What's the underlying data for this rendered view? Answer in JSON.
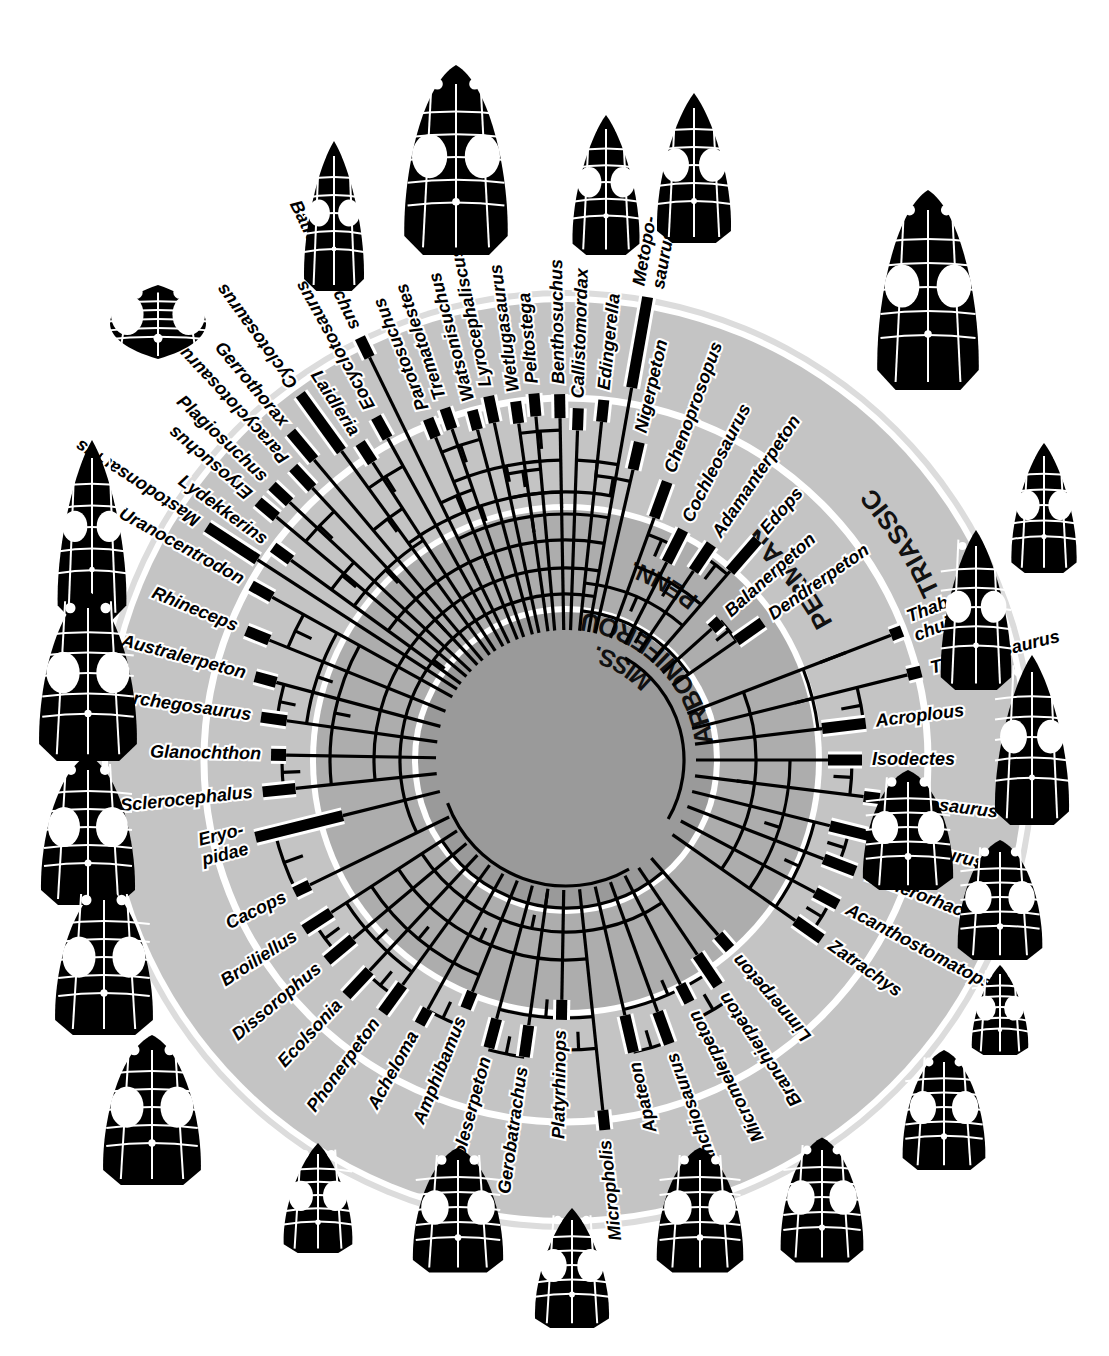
{
  "figure": {
    "type": "circular-phylogeny-with-stratigraphy",
    "center": [
      566,
      760
    ],
    "background_color": "#ffffff",
    "ring_separator_color": "#ffffff",
    "branch_color": "#000000",
    "range_bar_color": "#000000",
    "label_color": "#000000"
  },
  "periods": [
    {
      "name": "MISS.",
      "label": "MISS.",
      "r_inner": 0,
      "r_outer": 148,
      "fill": "#9a9a9a",
      "angle": -62
    },
    {
      "name": "PENN.",
      "label": "PENN.",
      "r_inner": 148,
      "r_outer": 250,
      "fill": "#adadad",
      "angle": -62
    },
    {
      "name": "CARBONIFEROUS",
      "label": "CARBONIFEROUS",
      "r_inner": 0,
      "r_outer": 250,
      "fill": null,
      "angle": -50
    },
    {
      "name": "PERMIAN",
      "label": "PERMIAN",
      "r_inner": 250,
      "r_outer": 360,
      "fill": "#c4c4c4",
      "angle": -44
    },
    {
      "name": "TRIASSIC",
      "label": "TRIASSIC",
      "r_inner": 360,
      "r_outer": 470,
      "fill": "#dcdcdc",
      "angle": -30
    }
  ],
  "ring_labels": [
    "MISS.",
    "PENN.",
    "CARBONIFEROUS",
    "PERMIAN",
    "TRIASSIC"
  ],
  "taxa": [
    {
      "name": "Metoposaurus",
      "label_lines": [
        "Metopo-",
        "saurus"
      ],
      "angle": -80,
      "bar_start": 378,
      "bar_end": 470,
      "tick_r": 300,
      "flip": false
    },
    {
      "name": "Callistomordax",
      "label_lines": [
        "Callistomordax"
      ],
      "angle": -88,
      "bar_start": 330,
      "bar_end": 352,
      "tick_r": 300,
      "flip": false
    },
    {
      "name": "Peltostega",
      "label_lines": [
        "Peltostega"
      ],
      "angle": -95,
      "bar_start": 345,
      "bar_end": 368,
      "tick_r": 300,
      "flip": false
    },
    {
      "name": "Lyrocephaliscus",
      "label_lines": [
        "Lyrocephaliscus"
      ],
      "angle": -102,
      "bar_start": 345,
      "bar_end": 372,
      "tick_r": 300,
      "flip": false
    },
    {
      "name": "Trematolestes",
      "label_lines": [
        "Trematolestes"
      ],
      "angle": -109,
      "bar_start": 350,
      "bar_end": 372,
      "tick_r": 300,
      "flip": false
    },
    {
      "name": "Batrachosuchus",
      "label_lines": [
        "Batrachosuchus"
      ],
      "angle": -116,
      "bar_start": 448,
      "bar_end": 470,
      "tick_r": 300,
      "flip": true
    },
    {
      "name": "Laidleria",
      "label_lines": [
        "Laidleria"
      ],
      "angle": -123,
      "bar_start": 355,
      "bar_end": 378,
      "tick_r": 300,
      "flip": true
    },
    {
      "name": "Gerrothorax",
      "label_lines": [
        "Gerrothorax"
      ],
      "angle": -130,
      "bar_start": 392,
      "bar_end": 428,
      "tick_r": 300,
      "flip": true
    },
    {
      "name": "Plagiosuchus",
      "label_lines": [
        "Plagiosuchus"
      ],
      "angle": -137,
      "bar_start": 378,
      "bar_end": 402,
      "tick_r": 300,
      "flip": true
    },
    {
      "name": "Lydekkerins",
      "label_lines": [
        "Lydekkerins"
      ],
      "angle": -144,
      "bar_start": 340,
      "bar_end": 362,
      "tick_r": 300,
      "flip": true
    },
    {
      "name": "Uranocentrodon",
      "label_lines": [
        "Uranocentrodon"
      ],
      "angle": -151,
      "bar_start": 336,
      "bar_end": 360,
      "tick_r": 300,
      "flip": true
    },
    {
      "name": "Rhineceps",
      "label_lines": [
        "Rhineceps"
      ],
      "angle": -158,
      "bar_start": 320,
      "bar_end": 345,
      "tick_r": 300,
      "flip": true
    },
    {
      "name": "Australerpeton",
      "label_lines": [
        "Australerpeton"
      ],
      "angle": -165,
      "bar_start": 300,
      "bar_end": 322,
      "tick_r": 300,
      "flip": true
    },
    {
      "name": "Archegosaurus",
      "label_lines": [
        "Archegosaurus"
      ],
      "angle": -172,
      "bar_start": 282,
      "bar_end": 308,
      "tick_r": 300,
      "flip": true
    },
    {
      "name": "Glanochthon",
      "label_lines": [
        "Glanochthon"
      ],
      "angle": -179,
      "bar_start": 280,
      "bar_end": 295,
      "tick_r": 300,
      "flip": true
    },
    {
      "name": "Sclerocephalus",
      "label_lines": [
        "Sclerocephalus"
      ],
      "angle": -186,
      "bar_start": 272,
      "bar_end": 305,
      "tick_r": 300,
      "flip": true
    },
    {
      "name": "Eryopidae",
      "label_lines": [
        "Eryo-",
        "pidae"
      ],
      "angle": -194,
      "bar_start": 230,
      "bar_end": 320,
      "tick_r": 300,
      "flip": true
    },
    {
      "name": "Cacops",
      "label_lines": [
        "Cacops"
      ],
      "angle": -206,
      "bar_start": 285,
      "bar_end": 302,
      "tick_r": 300,
      "flip": true
    },
    {
      "name": "Broiliellus",
      "label_lines": [
        "Broiliellus"
      ],
      "angle": -213,
      "bar_start": 280,
      "bar_end": 312,
      "tick_r": 300,
      "flip": true
    },
    {
      "name": "Dissorophus",
      "label_lines": [
        "Dissorophus"
      ],
      "angle": -220,
      "bar_start": 278,
      "bar_end": 312,
      "tick_r": 300,
      "flip": true
    },
    {
      "name": "Ecolsonia",
      "label_lines": [
        "Ecolsonia"
      ],
      "angle": -227,
      "bar_start": 288,
      "bar_end": 322,
      "tick_r": 300,
      "flip": true
    },
    {
      "name": "Phonerpeton",
      "label_lines": [
        "Phonerpeton"
      ],
      "angle": -234,
      "bar_start": 278,
      "bar_end": 312,
      "tick_r": 300,
      "flip": true
    },
    {
      "name": "Acheloma",
      "label_lines": [
        "Acheloma"
      ],
      "angle": -241,
      "bar_start": 285,
      "bar_end": 302,
      "tick_r": 300,
      "flip": true
    },
    {
      "name": "Amphibamus",
      "label_lines": [
        "Amphibamus"
      ],
      "angle": -248,
      "bar_start": 250,
      "bar_end": 268,
      "tick_r": 300,
      "flip": true
    },
    {
      "name": "Doleserpeton",
      "label_lines": [
        "Doleserpeton"
      ],
      "angle": -255,
      "bar_start": 268,
      "bar_end": 298,
      "tick_r": 300,
      "flip": true
    },
    {
      "name": "Gerobatrachus",
      "label_lines": [
        "Gerobatrachus"
      ],
      "angle": -262,
      "bar_start": 268,
      "bar_end": 300,
      "tick_r": 300,
      "flip": true
    },
    {
      "name": "Platyrhinops",
      "label_lines": [
        "Platyrhinops"
      ],
      "angle": -269,
      "bar_start": 240,
      "bar_end": 260,
      "tick_r": 300,
      "flip": true
    },
    {
      "name": "Micropholis",
      "label_lines": [
        "Micropholis"
      ],
      "angle": -276,
      "bar_start": 352,
      "bar_end": 372,
      "tick_r": 300,
      "flip": true
    },
    {
      "name": "Apateon",
      "label_lines": [
        "Apateon"
      ],
      "angle": -283,
      "bar_start": 262,
      "bar_end": 300,
      "tick_r": 300,
      "flip": true
    },
    {
      "name": "Branchiosaurus",
      "label_lines": [
        "Branchiosaurus"
      ],
      "angle": -290,
      "bar_start": 268,
      "bar_end": 302,
      "tick_r": 300,
      "flip": true
    },
    {
      "name": "Micromelerpeton",
      "label_lines": [
        "Micromelerpeton"
      ],
      "angle": -297,
      "bar_start": 252,
      "bar_end": 272,
      "tick_r": 300,
      "flip": true
    },
    {
      "name": "Branchierpeton",
      "label_lines": [
        "Branchierpeton"
      ],
      "angle": -304,
      "bar_start": 235,
      "bar_end": 272,
      "tick_r": 300,
      "flip": true
    },
    {
      "name": "Limnerpeton",
      "label_lines": [
        "Limnerpeton"
      ],
      "angle": -311,
      "bar_start": 232,
      "bar_end": 250,
      "tick_r": 300,
      "flip": true
    },
    {
      "name": "Zatrachys",
      "label_lines": [
        "Zatrachys"
      ],
      "angle": -325,
      "bar_start": 280,
      "bar_end": 312,
      "tick_r": 300,
      "flip": false
    },
    {
      "name": "Acanthostomatops",
      "label_lines": [
        "Acanthostomatops"
      ],
      "angle": -332,
      "bar_start": 282,
      "bar_end": 308,
      "tick_r": 300,
      "flip": false
    },
    {
      "name": "Trimerorhachis",
      "label_lines": [
        "Trimerorhachis"
      ],
      "angle": -339,
      "bar_start": 276,
      "bar_end": 310,
      "tick_r": 300,
      "flip": false
    },
    {
      "name": "Neldasaurus",
      "label_lines": [
        "Neldasaurus"
      ],
      "angle": -346,
      "bar_start": 272,
      "bar_end": 312,
      "tick_r": 300,
      "flip": false
    },
    {
      "name": "Dvinosaurus",
      "label_lines": [
        "Dvinosaurus"
      ],
      "angle": -353,
      "bar_start": 300,
      "bar_end": 316,
      "tick_r": 300,
      "flip": false
    },
    {
      "name": "Isodectes",
      "label_lines": [
        "Isodectes"
      ],
      "angle": -360,
      "bar_start": 262,
      "bar_end": 296,
      "tick_r": 300,
      "flip": false
    },
    {
      "name": "Acroplous",
      "label_lines": [
        "Acroplous"
      ],
      "angle": -367,
      "bar_start": 258,
      "bar_end": 302,
      "tick_r": 300,
      "flip": false
    },
    {
      "name": "Tupilakosaurus",
      "label_lines": [
        "Tupilakosaurus"
      ],
      "angle": -374,
      "bar_start": 352,
      "bar_end": 366,
      "tick_r": 300,
      "flip": false
    },
    {
      "name": "Thabanchuia",
      "label_lines": [
        "Thaban-",
        "chuia"
      ],
      "angle": -381,
      "bar_start": 348,
      "bar_end": 360,
      "tick_r": 300,
      "flip": false
    },
    {
      "name": "Dendrerpeton",
      "label_lines": [
        "Dendrerpeton"
      ],
      "angle": -395,
      "bar_start": 208,
      "bar_end": 240,
      "tick_r": 300,
      "flip": false
    },
    {
      "name": "Balanerpeton",
      "label_lines": [
        "Balanerpeton"
      ],
      "angle": -402,
      "bar_start": 196,
      "bar_end": 208,
      "tick_r": 300,
      "flip": false
    },
    {
      "name": "Edops",
      "label_lines": [
        "Edops"
      ],
      "angle": -409,
      "bar_start": 250,
      "bar_end": 292,
      "tick_r": 300,
      "flip": false
    },
    {
      "name": "Adamanterpeton",
      "label_lines": [
        "Adamanterpeton"
      ],
      "angle": -416,
      "bar_start": 228,
      "bar_end": 260,
      "tick_r": 300,
      "flip": false
    },
    {
      "name": "Cochleosaurus",
      "label_lines": [
        "Cochleosaurus"
      ],
      "angle": -423,
      "bar_start": 222,
      "bar_end": 258,
      "tick_r": 300,
      "flip": false
    },
    {
      "name": "Chenoprosopus",
      "label_lines": [
        "Chenoprosopus"
      ],
      "angle": -430,
      "bar_start": 258,
      "bar_end": 296,
      "tick_r": 300,
      "flip": false
    },
    {
      "name": "Nigerpeton",
      "label_lines": [
        "Nigerpeton"
      ],
      "angle": -437,
      "bar_start": 298,
      "bar_end": 326,
      "tick_r": 300,
      "flip": false
    },
    {
      "name": "Edingerella",
      "label_lines": [
        "Edingerella"
      ],
      "angle": -444,
      "bar_start": 340,
      "bar_end": 362,
      "tick_r": 300,
      "flip": false
    },
    {
      "name": "Benthosuchus",
      "label_lines": [
        "Benthosuchus"
      ],
      "angle": -451,
      "bar_start": 342,
      "bar_end": 366,
      "tick_r": 300,
      "flip": false
    },
    {
      "name": "Wetlugasaurus",
      "label_lines": [
        "Wetlugasaurus"
      ],
      "angle": -458,
      "bar_start": 340,
      "bar_end": 362,
      "tick_r": 300,
      "flip": false
    },
    {
      "name": "Watsonisuchus",
      "label_lines": [
        "Watsonisuchus"
      ],
      "angle": -465,
      "bar_start": 342,
      "bar_end": 362,
      "tick_r": 300,
      "flip": false
    },
    {
      "name": "Parotosuchus",
      "label_lines": [
        "Parotosuchus"
      ],
      "angle": -472,
      "bar_start": 348,
      "bar_end": 368,
      "tick_r": 300,
      "flip": false
    },
    {
      "name": "Eocyclotosaurus",
      "label_lines": [
        "Eocyclotosaurus"
      ],
      "angle": -479,
      "bar_start": 368,
      "bar_end": 392,
      "tick_r": 300,
      "flip": false
    },
    {
      "name": "Cyclotosaurus",
      "label_lines": [
        "Cyclotosaurus"
      ],
      "angle": -486,
      "bar_start": 382,
      "bar_end": 452,
      "tick_r": 300,
      "flip": false
    },
    {
      "name": "Paracyclotosaurus",
      "label_lines": [
        "Paracyclotosaurus"
      ],
      "angle": -493,
      "bar_start": 372,
      "bar_end": 400,
      "tick_r": 300,
      "flip": false
    },
    {
      "name": "Eryosuchus",
      "label_lines": [
        "Eryosuchus"
      ],
      "angle": -500,
      "bar_start": 378,
      "bar_end": 402,
      "tick_r": 300,
      "flip": false
    },
    {
      "name": "Mastodonsaurus",
      "label_lines": [
        "Mastodonsaurus"
      ],
      "angle": -507,
      "bar_start": 368,
      "bar_end": 428,
      "tick_r": 300,
      "flip": false
    }
  ],
  "skulls": [
    {
      "name": "skull-top-left-wide",
      "cx": 158,
      "cy": 322,
      "w": 128,
      "h": 74,
      "rot": 0,
      "style": "wide"
    },
    {
      "name": "skull-top-a",
      "cx": 334,
      "cy": 216,
      "w": 68,
      "h": 150,
      "rot": 0,
      "style": "narrow"
    },
    {
      "name": "skull-top-b",
      "cx": 456,
      "cy": 160,
      "w": 110,
      "h": 190,
      "rot": 0,
      "style": "broad"
    },
    {
      "name": "skull-top-c",
      "cx": 606,
      "cy": 185,
      "w": 76,
      "h": 140,
      "rot": 0,
      "style": "narrow"
    },
    {
      "name": "skull-top-d",
      "cx": 694,
      "cy": 168,
      "w": 84,
      "h": 150,
      "rot": 0,
      "style": "narrow"
    },
    {
      "name": "skull-top-right",
      "cx": 928,
      "cy": 290,
      "w": 108,
      "h": 200,
      "rot": 0,
      "style": "broad"
    },
    {
      "name": "skull-left-a",
      "cx": 92,
      "cy": 530,
      "w": 78,
      "h": 180,
      "rot": 0,
      "style": "narrow"
    },
    {
      "name": "skull-left-b",
      "cx": 88,
      "cy": 676,
      "w": 104,
      "h": 170,
      "rot": 0,
      "style": "broad"
    },
    {
      "name": "skull-left-c",
      "cx": 88,
      "cy": 830,
      "w": 100,
      "h": 150,
      "rot": 0,
      "style": "broad"
    },
    {
      "name": "skull-left-d",
      "cx": 104,
      "cy": 960,
      "w": 104,
      "h": 150,
      "rot": 0,
      "style": "broad"
    },
    {
      "name": "skull-left-e",
      "cx": 152,
      "cy": 1110,
      "w": 104,
      "h": 150,
      "rot": 0,
      "style": "broad"
    },
    {
      "name": "skull-bottom-a",
      "cx": 318,
      "cy": 1198,
      "w": 78,
      "h": 110,
      "rot": 0,
      "style": "narrow"
    },
    {
      "name": "skull-bottom-b",
      "cx": 458,
      "cy": 1210,
      "w": 96,
      "h": 125,
      "rot": 0,
      "style": "broad"
    },
    {
      "name": "skull-bottom-c",
      "cx": 572,
      "cy": 1268,
      "w": 84,
      "h": 120,
      "rot": 0,
      "style": "narrow"
    },
    {
      "name": "skull-bottom-d",
      "cx": 700,
      "cy": 1210,
      "w": 92,
      "h": 125,
      "rot": 0,
      "style": "broad"
    },
    {
      "name": "skull-bottom-e",
      "cx": 822,
      "cy": 1200,
      "w": 88,
      "h": 125,
      "rot": 0,
      "style": "broad"
    },
    {
      "name": "skull-right-a",
      "cx": 1044,
      "cy": 508,
      "w": 74,
      "h": 130,
      "rot": 0,
      "style": "narrow"
    },
    {
      "name": "skull-right-b",
      "cx": 976,
      "cy": 610,
      "w": 80,
      "h": 160,
      "rot": 0,
      "style": "narrow"
    },
    {
      "name": "skull-right-c",
      "cx": 1032,
      "cy": 740,
      "w": 84,
      "h": 170,
      "rot": 0,
      "style": "narrow"
    },
    {
      "name": "skull-right-d",
      "cx": 908,
      "cy": 830,
      "w": 96,
      "h": 120,
      "rot": 0,
      "style": "broad"
    },
    {
      "name": "skull-right-e",
      "cx": 1000,
      "cy": 900,
      "w": 90,
      "h": 120,
      "rot": 0,
      "style": "broad"
    },
    {
      "name": "skull-right-f",
      "cx": 1000,
      "cy": 1010,
      "w": 64,
      "h": 90,
      "rot": 0,
      "style": "narrow"
    },
    {
      "name": "skull-right-g",
      "cx": 944,
      "cy": 1110,
      "w": 88,
      "h": 120,
      "rot": 0,
      "style": "broad"
    }
  ]
}
